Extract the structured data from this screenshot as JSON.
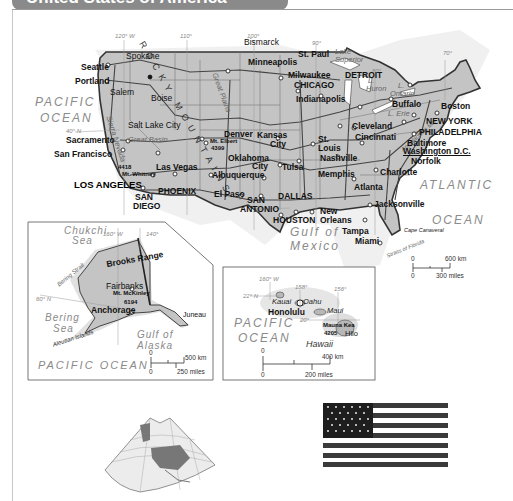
{
  "title": "United States of America",
  "main_map": {
    "graticule": [
      "120° W",
      "110°",
      "100°",
      "90°",
      "80°",
      "70°",
      "40° N",
      "30°"
    ],
    "mountain_label": "ROCKY MOUNTAINS",
    "oceans": [
      {
        "name": "PACIFIC OCEAN",
        "line1": "PACIFIC",
        "line2": "OCEAN"
      },
      {
        "name": "ATLANTIC OCEAN",
        "line1": "ATLANTIC",
        "line2": "OCEAN"
      },
      {
        "name": "Gulf of Mexico",
        "line1": "Gulf of",
        "line2": "Mexico"
      }
    ],
    "lakes": {
      "superior": [
        "Lake",
        "Superior"
      ],
      "huron": [
        "L.",
        "Huron"
      ],
      "ontario": [
        "L.",
        "Ontario"
      ],
      "erie": "L. Erie",
      "michigan": "L. Michigan"
    },
    "features": {
      "great_basin": "Great Basin",
      "great_plains": "Great Plains",
      "sierra_nevada": "Sierra Nevada",
      "grand_canyon": "Grand Canyon",
      "appalachian": "Appalachian Mts",
      "rio_grande": "Rio Grande",
      "cape_canaveral": "Cape Canaveral",
      "straits_florida": "Straits of Florida",
      "mt_whitney": "Mt. Whitney",
      "mt_whitney_elev": "4418",
      "mt_elbert": "Mt. Elbert",
      "mt_elbert_elev": "4399"
    },
    "cities": {
      "seattle": "Seattle",
      "portland": "Portland",
      "salem": "Salem",
      "spokane": "Spokane",
      "boise": "Boise",
      "sacramento": "Sacramento",
      "san_francisco": "San Francisco",
      "salt_lake_city": "Salt Lake City",
      "las_vegas": "Las Vegas",
      "los_angeles": "LOS ANGELES",
      "san_diego_1": "SAN",
      "san_diego_2": "DIEGO",
      "phoenix": "PHOENIX",
      "denver": "Denver",
      "albuquerque": "Albuquerque",
      "el_paso": "El Paso",
      "bismarck": "Bismarck",
      "minneapolis": "Minneapolis",
      "st_paul": "St. Paul",
      "milwaukee": "Milwaukee",
      "chicago": "CHICAGO",
      "detroit": "DETROIT",
      "kansas_city_1": "Kansas",
      "kansas_city_2": "City",
      "oklahoma_city_1": "Oklahoma",
      "oklahoma_city_2": "City",
      "tulsa": "Tulsa",
      "dallas": "DALLAS",
      "san_antonio_1": "SAN",
      "san_antonio_2": "ANTONIO",
      "houston": "HOUSTON",
      "indianapolis": "Indianapolis",
      "st_louis_1": "St.",
      "st_louis_2": "Louis",
      "nashville": "Nashville",
      "memphis": "Memphis",
      "new_orleans_1": "New",
      "new_orleans_2": "Orleans",
      "atlanta": "Atlanta",
      "jacksonville": "Jacksonville",
      "tampa": "Tampa",
      "miami": "Miami",
      "charlotte": "Charlotte",
      "norfolk": "Norfolk",
      "cleveland": "Cleveland",
      "cincinnati": "Cincinnati",
      "buffalo": "Buffalo",
      "boston": "Boston",
      "new_york": "NEW YORK",
      "philadelphia": "PHILADELPHIA",
      "baltimore": "Baltimore",
      "washington": "Washington D.C."
    },
    "scale": {
      "km_zero": "0",
      "km": "600 km",
      "mi_zero": "0",
      "mi": "300 miles"
    }
  },
  "alaska_inset": {
    "seas": {
      "chukchi": [
        "Chukchi",
        "Sea"
      ],
      "bering": [
        "Bering",
        "Sea"
      ],
      "gulf": [
        "Gulf of",
        "Alaska"
      ]
    },
    "ocean": "PACIFIC OCEAN",
    "graticule": [
      "160° W",
      "140°",
      "60° N"
    ],
    "features": {
      "brooks_range": "Brooks Range",
      "bering_strait": "Bering Strait",
      "aleutian": "Aleutian Islands",
      "mt_mckinley": "Mt. McKinley",
      "mt_mckinley_elev": "6194"
    },
    "cities": {
      "fairbanks": "Fairbanks",
      "anchorage": "Anchorage",
      "juneau": "Juneau"
    },
    "scale": {
      "km_zero": "0",
      "km": "500 km",
      "mi_zero": "0",
      "mi": "250 miles"
    }
  },
  "hawaii_inset": {
    "ocean": {
      "line1": "PACIFIC",
      "line2": "OCEAN"
    },
    "graticule": [
      "160° W",
      "158°",
      "156°",
      "22° N",
      "20°"
    ],
    "islands": {
      "kauai": "Kauai",
      "oahu": "Oahu",
      "maui": "Maui",
      "hawaii": "Hawaii"
    },
    "features": {
      "mauna_kea": "Mauna Kea",
      "mauna_kea_elev": "4205"
    },
    "cities": {
      "honolulu": "Honolulu",
      "hilo": "Hilo"
    },
    "scale": {
      "km_zero": "0",
      "km": "400 km",
      "mi_zero": "0",
      "mi": "200 miles"
    }
  },
  "locator_globe": {
    "label": "North America locator"
  },
  "flag": {
    "label": "United States flag",
    "stripe_color": "#3a3a3a",
    "canton_color": "#1e1e1e"
  },
  "colors": {
    "land": "#cfcfcf",
    "us_land": "#bdbdbd",
    "border": "#333333",
    "water_text": "#8a8a8a"
  }
}
